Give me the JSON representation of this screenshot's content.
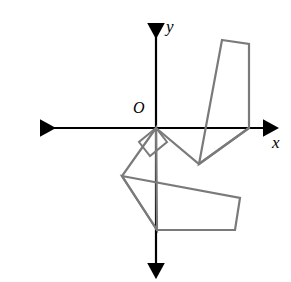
{
  "figure": {
    "type": "coordinate-plane-polygon-rotation",
    "width": 291,
    "height": 282,
    "background_color": "#ffffff"
  },
  "labels": {
    "origin": "O",
    "x_axis": "x",
    "y_axis": "y"
  },
  "colors": {
    "axis": "#000000",
    "shape_stroke": "#7a7a7a",
    "background": "#ffffff"
  },
  "axes": {
    "origin_px": {
      "x": 156,
      "y": 128
    },
    "x_axis": {
      "name": "x-axis",
      "from_px": {
        "x": 33,
        "y": 128
      },
      "to_px": {
        "x": 270,
        "y": 128
      },
      "arrow_both_ends": true,
      "stroke_width": 2.2
    },
    "y_axis": {
      "name": "y-axis",
      "from_px": {
        "x": 156,
        "y": 16
      },
      "to_px": {
        "x": 156,
        "y": 270
      },
      "arrow_both_ends": true,
      "stroke_width": 2.2
    },
    "label_positions_px": {
      "origin": {
        "x": 133,
        "y": 100
      },
      "x": {
        "x": 272,
        "y": 134
      },
      "y": {
        "x": 166,
        "y": 18
      }
    }
  },
  "shapes": [
    {
      "name": "upper-right-quadrilateral",
      "closed": true,
      "stroke": "#7a7a7a",
      "stroke_width": 2.2,
      "fill": "none",
      "points_px": [
        {
          "x": 222,
          "y": 40
        },
        {
          "x": 249,
          "y": 44
        },
        {
          "x": 249,
          "y": 128
        },
        {
          "x": 199,
          "y": 164
        }
      ]
    },
    {
      "name": "upper-right-triangle-at-origin",
      "closed": false,
      "stroke": "#7a7a7a",
      "stroke_width": 2.2,
      "fill": "none",
      "points_px": [
        {
          "x": 156,
          "y": 128
        },
        {
          "x": 199,
          "y": 164
        },
        {
          "x": 249,
          "y": 128
        }
      ]
    },
    {
      "name": "lower-left-quadrilateral",
      "closed": true,
      "stroke": "#7a7a7a",
      "stroke_width": 2.2,
      "fill": "none",
      "points_px": [
        {
          "x": 122,
          "y": 176
        },
        {
          "x": 240,
          "y": 198
        },
        {
          "x": 235,
          "y": 230
        },
        {
          "x": 157,
          "y": 230
        }
      ]
    },
    {
      "name": "lower-left-triangle-at-origin",
      "closed": true,
      "stroke": "#7a7a7a",
      "stroke_width": 2.2,
      "fill": "none",
      "points_px": [
        {
          "x": 156,
          "y": 128
        },
        {
          "x": 122,
          "y": 176
        },
        {
          "x": 157,
          "y": 230
        }
      ]
    },
    {
      "name": "right-angle-marker-square",
      "closed": true,
      "stroke": "#7a7a7a",
      "stroke_width": 2.0,
      "fill": "none",
      "points_px": [
        {
          "x": 156,
          "y": 128
        },
        {
          "x": 139,
          "y": 142
        },
        {
          "x": 150,
          "y": 156
        },
        {
          "x": 167,
          "y": 142
        }
      ]
    }
  ]
}
